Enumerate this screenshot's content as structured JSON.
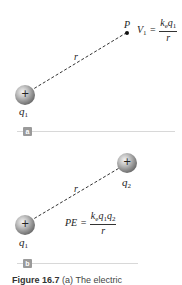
{
  "figure": {
    "panel_a": {
      "label": "a",
      "point_label": "P",
      "distance_label": "r",
      "charge": {
        "sign": "+",
        "name": "q",
        "subscript": "1"
      },
      "equation": {
        "lhs_symbol": "V",
        "lhs_subscript": "1",
        "equals": "=",
        "numerator_k": "k",
        "numerator_k_sub": "e",
        "numerator_q": "q",
        "numerator_q_sub": "1",
        "denominator": "r"
      }
    },
    "panel_b": {
      "label": "b",
      "distance_label": "r",
      "charge_1": {
        "sign": "+",
        "name": "q",
        "subscript": "1"
      },
      "charge_2": {
        "sign": "+",
        "name": "q",
        "subscript": "2"
      },
      "equation": {
        "lhs": "PE",
        "equals": "=",
        "numerator_k": "k",
        "numerator_k_sub": "e",
        "numerator_q1": "q",
        "numerator_q1_sub": "1",
        "numerator_q2": "q",
        "numerator_q2_sub": "2",
        "denominator": "r"
      }
    },
    "caption": {
      "label": "Figure 16.7",
      "text": "(a) The electric"
    },
    "colors": {
      "sphere_light": "#f2f2f2",
      "sphere_dark": "#7a7a7a",
      "dash_line": "#333333",
      "panel_label_bg": "#9a9a9a",
      "rule": "#d8d8d8"
    }
  }
}
